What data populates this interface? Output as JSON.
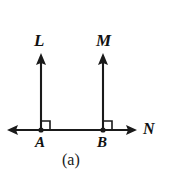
{
  "figure": {
    "caption": "(a)",
    "background_color": "#ffffff",
    "stroke_color": "#1a1a1a",
    "labels": {
      "ray_left": "L",
      "ray_right": "M",
      "point_left": "A",
      "point_right": "B",
      "baseline": "N"
    },
    "geometry": {
      "baseline": {
        "name": "line-N",
        "y": 130,
        "x_start": 8,
        "x_end": 136,
        "arrow_left": true,
        "arrow_right": true
      },
      "rays": [
        {
          "name": "ray-L",
          "x": 41,
          "y_base": 130,
          "y_tip": 55,
          "arrow_up": true,
          "label": "L",
          "foot_label": "A"
        },
        {
          "name": "ray-M",
          "x": 103,
          "y_base": 130,
          "y_tip": 55,
          "arrow_up": true,
          "label": "M",
          "foot_label": "B"
        }
      ],
      "right_angle_marks": [
        {
          "name": "right-angle-A",
          "x": 41,
          "y": 130,
          "size": 8,
          "side": "right"
        },
        {
          "name": "right-angle-B",
          "x": 103,
          "y": 130,
          "size": 8,
          "side": "right"
        }
      ],
      "points": [
        {
          "name": "point-A",
          "x": 41,
          "y": 130,
          "radius": 2.6
        },
        {
          "name": "point-B",
          "x": 103,
          "y": 130,
          "radius": 2.6
        }
      ]
    }
  }
}
